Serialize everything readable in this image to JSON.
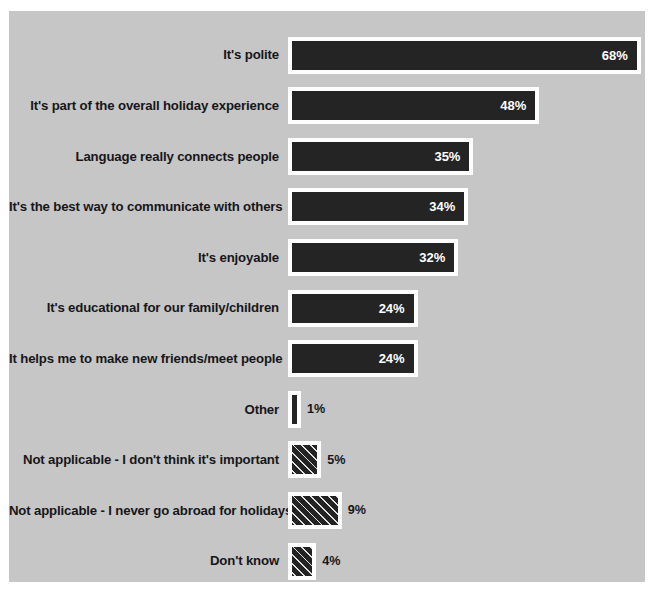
{
  "chart_data": {
    "type": "bar",
    "orientation": "horizontal",
    "title": "",
    "xlabel": "",
    "ylabel": "",
    "xlim": [
      0,
      68
    ],
    "grid": false,
    "legend": "none",
    "value_suffix": "%",
    "categories": [
      "It's polite",
      "It's part of the overall holiday experience",
      "Language really connects people",
      "It's the best way to communicate with others",
      "It's enjoyable",
      "It's educational for our family/children",
      "It helps me to make new friends/meet people",
      "Other",
      "Not applicable - I don't think it's important",
      "Not applicable - I never go abroad for holidays",
      "Don't know"
    ],
    "values": [
      68,
      48,
      35,
      34,
      32,
      24,
      24,
      1,
      5,
      9,
      4
    ],
    "value_labels": [
      "68%",
      "48%",
      "35%",
      "34%",
      "32%",
      "24%",
      "24%",
      "1%",
      "5%",
      "9%",
      "4%"
    ],
    "bar_styles": [
      "solid",
      "solid",
      "solid",
      "solid",
      "solid",
      "solid",
      "solid",
      "solid",
      "patterned",
      "patterned",
      "patterned"
    ],
    "label_placement": [
      "inside",
      "inside",
      "inside",
      "inside",
      "inside",
      "inside",
      "inside",
      "outside",
      "outside",
      "outside",
      "outside"
    ],
    "colors": {
      "panel_background": "#c6c6c6",
      "page_background": "#ffffff",
      "bar_fill": "#242424",
      "bar_border": "#fdfdfd",
      "label_text": "#16161a",
      "value_text_inside": "#ffffff",
      "value_text_outside": "#16161a"
    }
  }
}
